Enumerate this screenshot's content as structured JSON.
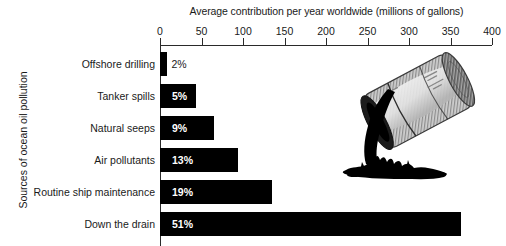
{
  "chart_data": {
    "type": "bar",
    "orientation": "horizontal",
    "title": "Average contribution per year worldwide (millions of gallons)",
    "xlabel": "Average contribution per year worldwide (millions of gallons)",
    "ylabel": "Sources of ocean oil pollution",
    "xlim": [
      0,
      400
    ],
    "xticks": [
      0,
      50,
      100,
      150,
      200,
      250,
      300,
      350,
      400
    ],
    "xticklabels": [
      "0",
      "50",
      "100",
      "150",
      "200",
      "250",
      "300",
      "350",
      "400"
    ],
    "grid": false,
    "legend": false,
    "categories": [
      "Offshore drilling",
      "Tanker spills",
      "Natural seeps",
      "Air pollutants",
      "Routine ship maintenance",
      "Down the drain"
    ],
    "values": [
      9,
      43,
      65,
      94,
      135,
      363
    ],
    "data_labels": [
      "2%",
      "5%",
      "9%",
      "13%",
      "19%",
      "51%"
    ],
    "percentages": [
      2,
      5,
      9,
      13,
      19,
      51
    ],
    "bar_color": "#000000",
    "label_inside_color": "#ffffff",
    "label_outside_color": "#1a1a1a"
  },
  "illustration": {
    "name": "oil-drum-spilling-illustration",
    "description": "Tipped oil drum pouring black oil into a splash puddle",
    "drum_body_color": "#d9d9d9",
    "drum_shade_color": "#8f8f8f",
    "oil_color": "#000000"
  }
}
